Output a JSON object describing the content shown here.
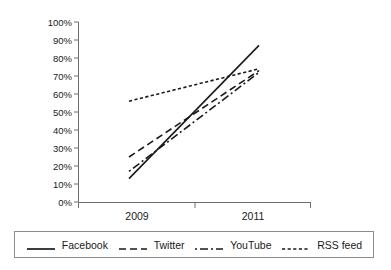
{
  "chart_data": {
    "type": "line",
    "title": "",
    "xlabel": "",
    "ylabel": "",
    "x": [
      "2009",
      "2011"
    ],
    "categories": [
      "2009",
      "2011"
    ],
    "series": [
      {
        "name": "Facebook",
        "values": [
          13,
          87
        ],
        "style": "solid"
      },
      {
        "name": "Twitter",
        "values": [
          25,
          73
        ],
        "style": "dashed"
      },
      {
        "name": "YouTube",
        "values": [
          17,
          72
        ],
        "style": "dash-dot"
      },
      {
        "name": "RSS feed",
        "values": [
          56,
          74
        ],
        "style": "dotted"
      }
    ],
    "ylim": [
      0,
      100
    ],
    "y_ticks": [
      "0%",
      "10%",
      "20%",
      "30%",
      "40%",
      "50%",
      "60%",
      "70%",
      "80%",
      "90%",
      "100%"
    ],
    "x_ticks": [
      "2009",
      "2011"
    ],
    "grid": false,
    "legend_position": "bottom"
  },
  "axes": {
    "y_tick_labels": [
      "100%",
      "90%",
      "80%",
      "70%",
      "60%",
      "50%",
      "40%",
      "30%",
      "20%",
      "10%",
      "0%"
    ],
    "x_tick_labels": [
      "2009",
      "2011"
    ]
  },
  "legend": {
    "entries": [
      {
        "label": "Facebook"
      },
      {
        "label": "Twitter"
      },
      {
        "label": "YouTube"
      },
      {
        "label": "RSS feed"
      }
    ]
  },
  "colors": {
    "line": "#1a1a1a",
    "axis": "#6e6e6e",
    "background": "#ffffff",
    "legend_border": "#8c8c8c"
  }
}
